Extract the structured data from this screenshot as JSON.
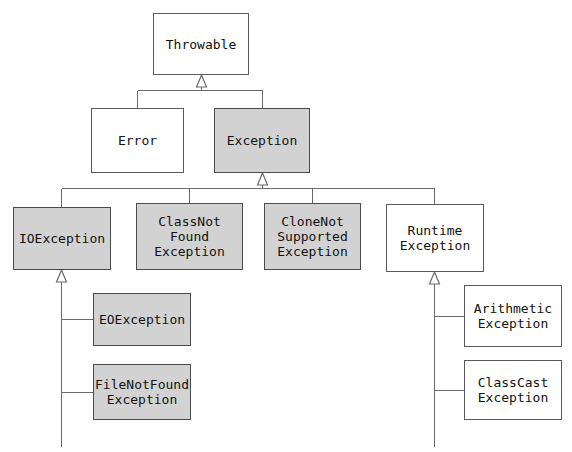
{
  "diagram": {
    "type": "class-hierarchy",
    "background_color": "#ffffff",
    "shaded_fill_color": "#d2d2d2",
    "plain_fill_color": "#ffffff",
    "border_color": "#5a5a5a",
    "text_color": "#111111",
    "arrow_style": "hollow-triangle-inheritance",
    "canvas": {
      "width": 572,
      "height": 452
    },
    "nodes": [
      {
        "id": "throwable",
        "label": "Throwable",
        "shaded": false,
        "x": 153,
        "y": 13,
        "w": 96,
        "h": 62
      },
      {
        "id": "error",
        "label": "Error",
        "shaded": false,
        "x": 91,
        "y": 108,
        "w": 93,
        "h": 65
      },
      {
        "id": "exception",
        "label": "Exception",
        "shaded": true,
        "x": 214,
        "y": 108,
        "w": 96,
        "h": 65
      },
      {
        "id": "ioexception",
        "label": "IOException",
        "shaded": true,
        "x": 13,
        "y": 207,
        "w": 98,
        "h": 63
      },
      {
        "id": "classnotfound",
        "label": "ClassNot\nFound\nException",
        "shaded": true,
        "x": 136,
        "y": 203,
        "w": 107,
        "h": 67
      },
      {
        "id": "clonenotsupported",
        "label": "CloneNot\nSupported\nException",
        "shaded": true,
        "x": 264,
        "y": 203,
        "w": 97,
        "h": 67
      },
      {
        "id": "runtimeexception",
        "label": "Runtime\nException",
        "shaded": false,
        "x": 386,
        "y": 204,
        "w": 98,
        "h": 68
      },
      {
        "id": "eofexception",
        "label": "EOException",
        "shaded": true,
        "x": 93,
        "y": 293,
        "w": 98,
        "h": 53
      },
      {
        "id": "filenotfound",
        "label": "FileNotFound\nException",
        "shaded": true,
        "x": 93,
        "y": 364,
        "w": 98,
        "h": 56
      },
      {
        "id": "arithmetic",
        "label": "Arithmetic\nException",
        "shaded": false,
        "x": 464,
        "y": 285,
        "w": 98,
        "h": 62
      },
      {
        "id": "classcast",
        "label": "ClassCast\nException",
        "shaded": false,
        "x": 464,
        "y": 360,
        "w": 98,
        "h": 60
      }
    ],
    "edges": [
      {
        "from": "error",
        "to": "throwable",
        "style": "elbow-up"
      },
      {
        "from": "exception",
        "to": "throwable",
        "style": "elbow-up-arrow"
      },
      {
        "from": "ioexception",
        "to": "exception",
        "style": "bus-up"
      },
      {
        "from": "classnotfound",
        "to": "exception",
        "style": "bus-up"
      },
      {
        "from": "clonenotsupported",
        "to": "exception",
        "style": "bus-up"
      },
      {
        "from": "runtimeexception",
        "to": "exception",
        "style": "bus-up-arrow"
      },
      {
        "from": "eofexception",
        "to": "ioexception",
        "style": "trunk-right"
      },
      {
        "from": "filenotfound",
        "to": "ioexception",
        "style": "trunk-right"
      },
      {
        "from": "arithmetic",
        "to": "runtimeexception",
        "style": "trunk-right"
      },
      {
        "from": "classcast",
        "to": "runtimeexception",
        "style": "trunk-right"
      }
    ]
  }
}
